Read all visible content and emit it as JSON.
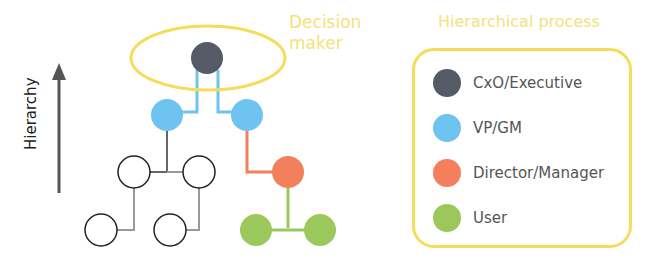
{
  "diagram": {
    "decision_maker_label": "Decision\nmaker",
    "axis_label": "Hierarchy",
    "legend": {
      "title": "Hierarchical process",
      "items": [
        {
          "label": "CxO/Executive",
          "color": "#545b66"
        },
        {
          "label": "VP/GM",
          "color": "#6ec3f0"
        },
        {
          "label": "Director/Manager",
          "color": "#f47f5c"
        },
        {
          "label": "User",
          "color": "#9cc75a"
        }
      ]
    },
    "colors": {
      "highlight": "#f3dd5a",
      "executive": "#545b66",
      "vp": "#6ec3f0",
      "director": "#f47f5c",
      "user": "#9cc75a",
      "neutral_line": "#999999"
    }
  }
}
